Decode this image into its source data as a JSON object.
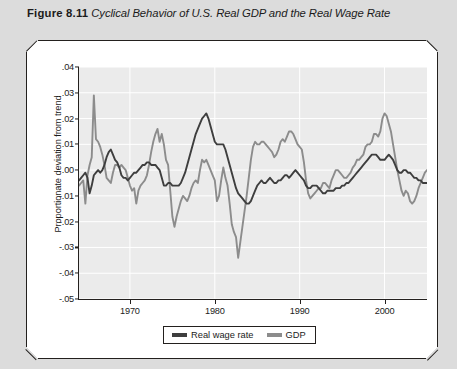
{
  "caption": {
    "figure_number": "Figure 8.11",
    "title": "Cyclical Behavior of U.S. Real GDP and the Real Wage Rate"
  },
  "legend": {
    "items": [
      {
        "label": "Real wage rate",
        "color": "#3e3e3e"
      },
      {
        "label": "GDP",
        "color": "#8c8c8c"
      }
    ]
  },
  "chart_data": {
    "type": "line",
    "title": "Cyclical Behavior of U.S. Real GDP and the Real Wage Rate",
    "xlabel": "",
    "ylabel": "Proportionate deviation from trend",
    "xlim": [
      1964.0,
      2005.0
    ],
    "ylim": [
      -0.05,
      0.04
    ],
    "xticks": [
      1970,
      1980,
      1990,
      2000
    ],
    "xtick_labels": [
      "1970",
      "1980",
      "1990",
      "2000"
    ],
    "yticks": [
      0.04,
      0.03,
      0.02,
      0.01,
      0.0,
      -0.01,
      -0.02,
      -0.03,
      -0.04,
      -0.05
    ],
    "ytick_labels": [
      ".04",
      ".03",
      ".02",
      ".01",
      ".00",
      "-.01",
      "-.02",
      "-.03",
      "-.04",
      "-.05"
    ],
    "grid": true,
    "grid_color": "#ffffff",
    "plot_background": "#ebebeb",
    "legend_position": "below-center",
    "x": [
      1964.0,
      1964.25,
      1964.5,
      1964.75,
      1965.0,
      1965.25,
      1965.5,
      1965.75,
      1966.0,
      1966.25,
      1966.5,
      1966.75,
      1967.0,
      1967.25,
      1967.5,
      1967.75,
      1968.0,
      1968.25,
      1968.5,
      1968.75,
      1969.0,
      1969.25,
      1969.5,
      1969.75,
      1970.0,
      1970.25,
      1970.5,
      1970.75,
      1971.0,
      1971.25,
      1971.5,
      1971.75,
      1972.0,
      1972.25,
      1972.5,
      1972.75,
      1973.0,
      1973.25,
      1973.5,
      1973.75,
      1974.0,
      1974.25,
      1974.5,
      1974.75,
      1975.0,
      1975.25,
      1975.5,
      1975.75,
      1976.0,
      1976.25,
      1976.5,
      1976.75,
      1977.0,
      1977.25,
      1977.5,
      1977.75,
      1978.0,
      1978.25,
      1978.5,
      1978.75,
      1979.0,
      1979.25,
      1979.5,
      1979.75,
      1980.0,
      1980.25,
      1980.5,
      1980.75,
      1981.0,
      1981.25,
      1981.5,
      1981.75,
      1982.0,
      1982.25,
      1982.5,
      1982.75,
      1983.0,
      1983.25,
      1983.5,
      1983.75,
      1984.0,
      1984.25,
      1984.5,
      1984.75,
      1985.0,
      1985.25,
      1985.5,
      1985.75,
      1986.0,
      1986.25,
      1986.5,
      1986.75,
      1987.0,
      1987.25,
      1987.5,
      1987.75,
      1988.0,
      1988.25,
      1988.5,
      1988.75,
      1989.0,
      1989.25,
      1989.5,
      1989.75,
      1990.0,
      1990.25,
      1990.5,
      1990.75,
      1991.0,
      1991.25,
      1991.5,
      1991.75,
      1992.0,
      1992.25,
      1992.5,
      1992.75,
      1993.0,
      1993.25,
      1993.5,
      1993.75,
      1994.0,
      1994.25,
      1994.5,
      1994.75,
      1995.0,
      1995.25,
      1995.5,
      1995.75,
      1996.0,
      1996.25,
      1996.5,
      1996.75,
      1997.0,
      1997.25,
      1997.5,
      1997.75,
      1998.0,
      1998.25,
      1998.5,
      1998.75,
      1999.0,
      1999.25,
      1999.5,
      1999.75,
      2000.0,
      2000.25,
      2000.5,
      2000.75,
      2001.0,
      2001.25,
      2001.5,
      2001.75,
      2002.0,
      2002.25,
      2002.5,
      2002.75,
      2003.0,
      2003.25,
      2003.5,
      2003.75,
      2004.0,
      2004.25,
      2004.5,
      2004.75,
      2005.0
    ],
    "series": [
      {
        "name": "Real wage rate",
        "color": "#3e3e3e",
        "values": [
          -0.004,
          -0.003,
          -0.002,
          -0.001,
          -0.003,
          -0.009,
          -0.006,
          -0.002,
          -0.001,
          0.0,
          -0.001,
          0.0,
          0.002,
          0.005,
          0.007,
          0.008,
          0.006,
          0.004,
          0.003,
          0.001,
          -0.002,
          -0.003,
          -0.003,
          -0.004,
          -0.003,
          -0.002,
          -0.001,
          -0.001,
          0.0,
          0.001,
          0.002,
          0.002,
          0.003,
          0.003,
          0.002,
          0.002,
          0.002,
          0.001,
          0.0,
          -0.003,
          -0.006,
          -0.006,
          -0.005,
          -0.005,
          -0.006,
          -0.006,
          -0.006,
          -0.006,
          -0.005,
          -0.003,
          -0.001,
          0.002,
          0.005,
          0.008,
          0.011,
          0.014,
          0.016,
          0.018,
          0.02,
          0.021,
          0.022,
          0.02,
          0.017,
          0.014,
          0.011,
          0.01,
          0.01,
          0.01,
          0.01,
          0.008,
          0.005,
          0.002,
          -0.001,
          -0.004,
          -0.007,
          -0.009,
          -0.01,
          -0.011,
          -0.012,
          -0.013,
          -0.013,
          -0.012,
          -0.01,
          -0.008,
          -0.006,
          -0.005,
          -0.004,
          -0.005,
          -0.005,
          -0.004,
          -0.003,
          -0.004,
          -0.005,
          -0.005,
          -0.004,
          -0.004,
          -0.003,
          -0.002,
          -0.002,
          -0.003,
          -0.002,
          -0.001,
          0.0,
          -0.001,
          -0.002,
          -0.003,
          -0.004,
          -0.006,
          -0.007,
          -0.007,
          -0.006,
          -0.006,
          -0.006,
          -0.007,
          -0.008,
          -0.009,
          -0.009,
          -0.008,
          -0.008,
          -0.008,
          -0.008,
          -0.007,
          -0.007,
          -0.007,
          -0.006,
          -0.006,
          -0.005,
          -0.005,
          -0.004,
          -0.003,
          -0.002,
          -0.001,
          0.0,
          0.001,
          0.002,
          0.003,
          0.004,
          0.005,
          0.006,
          0.006,
          0.006,
          0.005,
          0.004,
          0.004,
          0.004,
          0.005,
          0.006,
          0.005,
          0.004,
          0.002,
          0.0,
          -0.001,
          -0.001,
          0.0,
          0.0,
          -0.001,
          -0.001,
          -0.002,
          -0.003,
          -0.003,
          -0.004,
          -0.004,
          -0.005,
          -0.005,
          -0.005
        ]
      },
      {
        "name": "GDP",
        "color": "#8c8c8c",
        "values": [
          -0.006,
          -0.005,
          -0.004,
          -0.013,
          -0.002,
          0.002,
          0.005,
          0.029,
          0.012,
          0.011,
          0.009,
          0.006,
          0.002,
          -0.003,
          -0.004,
          -0.005,
          -0.001,
          0.002,
          0.002,
          0.001,
          0.002,
          0.001,
          0.0,
          -0.003,
          -0.006,
          -0.008,
          -0.007,
          -0.013,
          -0.008,
          -0.006,
          -0.005,
          -0.004,
          -0.002,
          0.002,
          0.007,
          0.011,
          0.014,
          0.016,
          0.011,
          0.014,
          0.01,
          0.004,
          0.002,
          -0.008,
          -0.018,
          -0.022,
          -0.018,
          -0.015,
          -0.012,
          -0.01,
          -0.011,
          -0.012,
          -0.01,
          -0.007,
          -0.005,
          -0.004,
          -0.005,
          0.0,
          0.004,
          0.003,
          0.004,
          0.002,
          0.0,
          -0.002,
          -0.004,
          -0.012,
          -0.01,
          -0.004,
          0.001,
          -0.003,
          -0.006,
          -0.013,
          -0.021,
          -0.024,
          -0.026,
          -0.034,
          -0.028,
          -0.022,
          -0.016,
          -0.01,
          -0.003,
          0.004,
          0.009,
          0.011,
          0.01,
          0.01,
          0.011,
          0.011,
          0.01,
          0.009,
          0.008,
          0.007,
          0.005,
          0.006,
          0.008,
          0.011,
          0.012,
          0.011,
          0.013,
          0.015,
          0.015,
          0.014,
          0.012,
          0.01,
          0.009,
          0.008,
          0.003,
          -0.004,
          -0.009,
          -0.011,
          -0.01,
          -0.009,
          -0.008,
          -0.007,
          -0.007,
          -0.005,
          -0.005,
          -0.006,
          -0.007,
          -0.004,
          -0.002,
          0.0,
          0.0,
          -0.001,
          -0.002,
          -0.003,
          -0.003,
          -0.002,
          -0.001,
          0.001,
          0.002,
          0.004,
          0.004,
          0.005,
          0.006,
          0.009,
          0.01,
          0.01,
          0.011,
          0.014,
          0.014,
          0.013,
          0.015,
          0.02,
          0.022,
          0.021,
          0.018,
          0.015,
          0.01,
          0.005,
          0.0,
          -0.004,
          -0.008,
          -0.01,
          -0.008,
          -0.009,
          -0.012,
          -0.013,
          -0.012,
          -0.01,
          -0.007,
          -0.005,
          -0.003,
          -0.001,
          0.0
        ]
      }
    ]
  }
}
